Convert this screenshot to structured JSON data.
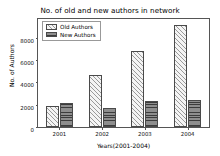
{
  "chart_data": {
    "type": "bar",
    "title": "No. of old and new authors in network",
    "xlabel": "Years(2001-2004)",
    "ylabel": "No. of Authors",
    "categories": [
      "2001",
      "2002",
      "2003",
      "2004"
    ],
    "series": [
      {
        "name": "Old Authors",
        "values": [
          1900,
          4650,
          6800,
          9200
        ]
      },
      {
        "name": "New Authors",
        "values": [
          2150,
          1750,
          2300,
          2400
        ]
      }
    ],
    "ylim": [
      0,
      9700
    ],
    "yticks": [
      0,
      2000,
      4000,
      6000,
      8000
    ],
    "ytick_labels": [
      "0",
      "2000",
      "4000",
      "6000",
      "8000"
    ],
    "grid": false,
    "legend_position": "upper left",
    "colors": {
      "old_authors_hatch": "#9a9a9a",
      "old_authors_face": "#f4f4f4",
      "new_authors_hatch": "#3c3c3c",
      "new_authors_face": "#8e8e8e",
      "edge": "#4a4a4a",
      "axis": "#555555",
      "text": "#000000",
      "background": "#ffffff"
    }
  }
}
